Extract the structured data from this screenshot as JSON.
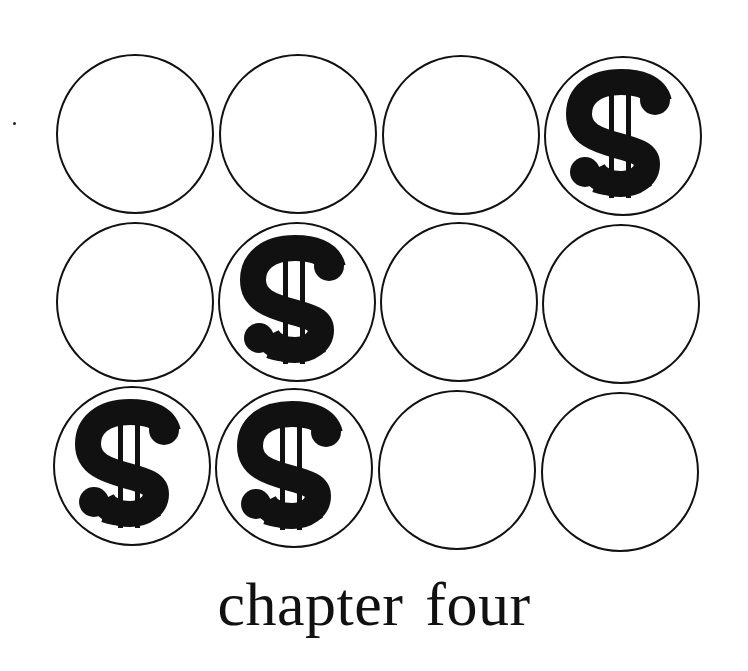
{
  "title": {
    "word1": "chapter",
    "word2": "four"
  },
  "grid": {
    "rows": 3,
    "columns": 4,
    "cells": [
      {
        "row": 1,
        "col": 1,
        "icon": "empty"
      },
      {
        "row": 1,
        "col": 2,
        "icon": "empty"
      },
      {
        "row": 1,
        "col": 3,
        "icon": "empty"
      },
      {
        "row": 1,
        "col": 4,
        "icon": "dollar-sign",
        "glyph": "$"
      },
      {
        "row": 2,
        "col": 1,
        "icon": "empty"
      },
      {
        "row": 2,
        "col": 2,
        "icon": "dollar-sign",
        "glyph": "$"
      },
      {
        "row": 2,
        "col": 3,
        "icon": "empty"
      },
      {
        "row": 2,
        "col": 4,
        "icon": "empty"
      },
      {
        "row": 3,
        "col": 1,
        "icon": "dollar-sign",
        "glyph": "$"
      },
      {
        "row": 3,
        "col": 2,
        "icon": "dollar-sign",
        "glyph": "$"
      },
      {
        "row": 3,
        "col": 3,
        "icon": "empty"
      },
      {
        "row": 3,
        "col": 4,
        "icon": "empty"
      }
    ]
  },
  "colors": {
    "ink": "#111111",
    "paper": "#ffffff"
  }
}
